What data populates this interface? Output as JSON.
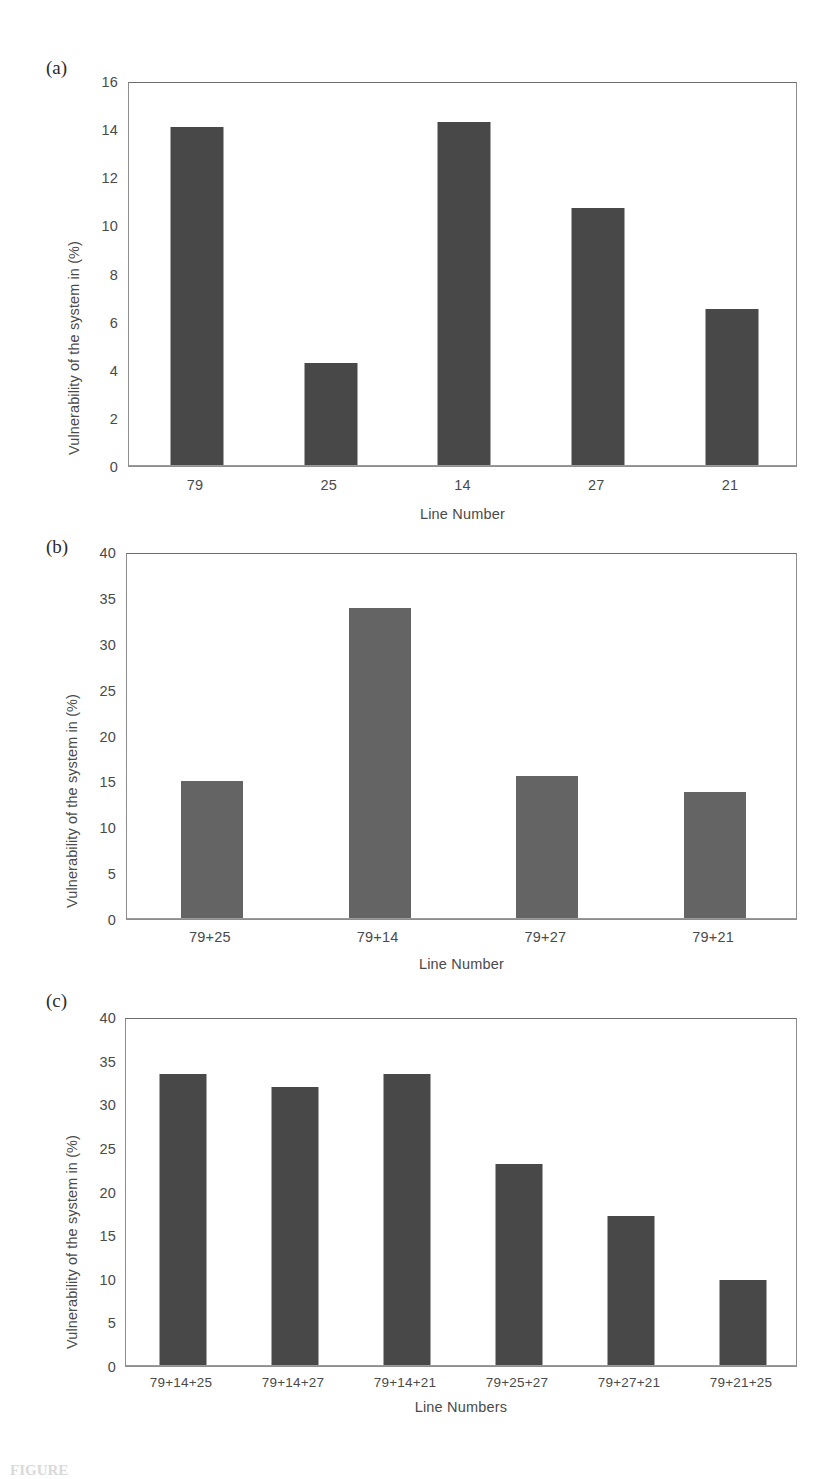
{
  "figure": {
    "caption_partial": "FIGURE",
    "panels": [
      {
        "letter": "(a)"
      },
      {
        "letter": "(b)"
      },
      {
        "letter": "(c)"
      }
    ]
  },
  "chart_data": [
    {
      "type": "bar",
      "panel": "(a)",
      "title": "",
      "xlabel": "Line Number",
      "ylabel": "Vulnerability of the system in (%)",
      "categories": [
        "79",
        "25",
        "14",
        "27",
        "21"
      ],
      "values": [
        14.1,
        4.25,
        14.35,
        10.75,
        6.5
      ],
      "ylim": [
        0,
        16
      ],
      "yticks": [
        0,
        2,
        4,
        6,
        8,
        10,
        12,
        14,
        16
      ],
      "grid": false,
      "legend": "none",
      "bar_color": "#484848"
    },
    {
      "type": "bar",
      "panel": "(b)",
      "title": "",
      "xlabel": "Line Number",
      "ylabel": "Vulnerability of the system in (%)",
      "categories": [
        "79+25",
        "79+14",
        "79+27",
        "79+21"
      ],
      "values": [
        15.0,
        34.0,
        15.6,
        13.8
      ],
      "ylim": [
        0,
        40
      ],
      "yticks": [
        0,
        5,
        10,
        15,
        20,
        25,
        30,
        35,
        40
      ],
      "grid": false,
      "legend": "none",
      "bar_color": "#646464"
    },
    {
      "type": "bar",
      "panel": "(c)",
      "title": "",
      "xlabel": "Line Numbers",
      "ylabel": "Vulnerability of the system in (%)",
      "categories": [
        "79+14+25",
        "79+14+27",
        "79+14+21",
        "79+25+27",
        "79+27+21",
        "79+21+25"
      ],
      "values": [
        33.5,
        32.1,
        33.6,
        23.2,
        17.2,
        9.8
      ],
      "ylim": [
        0,
        40
      ],
      "yticks": [
        0,
        5,
        10,
        15,
        20,
        25,
        30,
        35,
        40
      ],
      "grid": false,
      "legend": "none",
      "bar_color": "#484848"
    }
  ]
}
